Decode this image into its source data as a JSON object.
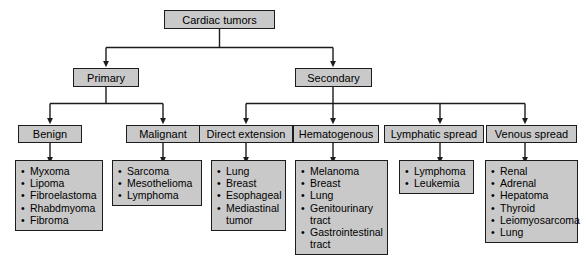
{
  "diagram": {
    "type": "flowchart",
    "colors": {
      "box_fill": "#c9c9c9",
      "box_border": "#1c1c1c",
      "connector": "#1c1c1c",
      "background": "#ffffff"
    },
    "root": {
      "label": "Cardiac tumors"
    },
    "level2": [
      {
        "label": "Primary"
      },
      {
        "label": "Secondary"
      }
    ],
    "level3": [
      {
        "label": "Benign"
      },
      {
        "label": "Malignant"
      },
      {
        "label": "Direct extension"
      },
      {
        "label": "Hematogenous"
      },
      {
        "label": "Lymphatic spread"
      },
      {
        "label": "Venous spread"
      }
    ],
    "lists": [
      {
        "parent": "Benign",
        "items": [
          {
            "text": "Myxoma"
          },
          {
            "text": "Lipoma"
          },
          {
            "text": "Fibroelastoma"
          },
          {
            "text": "Rhabdmyoma"
          },
          {
            "text": "Fibroma"
          }
        ]
      },
      {
        "parent": "Malignant",
        "items": [
          {
            "text": "Sarcoma"
          },
          {
            "text": "Mesothelioma"
          },
          {
            "text": "Lymphoma"
          }
        ]
      },
      {
        "parent": "Direct extension",
        "items": [
          {
            "text": "Lung"
          },
          {
            "text": "Breast"
          },
          {
            "text": "Esophageal"
          },
          {
            "text": "Mediastinal",
            "cont": "tumor"
          }
        ]
      },
      {
        "parent": "Hematogenous",
        "items": [
          {
            "text": "Melanoma"
          },
          {
            "text": "Breast"
          },
          {
            "text": "Lung"
          },
          {
            "text": "Genitourinary",
            "cont": "tract"
          },
          {
            "text": "Gastrointestinal",
            "cont": "tract"
          }
        ]
      },
      {
        "parent": "Lymphatic spread",
        "items": [
          {
            "text": "Lymphoma"
          },
          {
            "text": "Leukemia"
          }
        ]
      },
      {
        "parent": "Venous spread",
        "items": [
          {
            "text": "Renal"
          },
          {
            "text": "Adrenal"
          },
          {
            "text": "Hepatoma"
          },
          {
            "text": "Thyroid"
          },
          {
            "text": "Leiomyosarcoma"
          },
          {
            "text": "Lung"
          }
        ]
      }
    ],
    "bullet_glyph": "•"
  }
}
